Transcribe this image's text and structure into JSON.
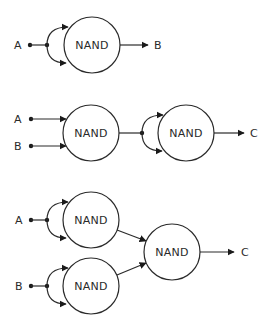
{
  "diagrams": [
    {
      "name": "not-gate-from-nand",
      "inputs": [
        "A"
      ],
      "gates": [
        "NAND"
      ],
      "output": "B"
    },
    {
      "name": "and-gate-from-nand",
      "inputs": [
        "A",
        "B"
      ],
      "gates": [
        "NAND",
        "NAND"
      ],
      "output": "C"
    },
    {
      "name": "or-gate-from-nand",
      "inputs": [
        "A",
        "B"
      ],
      "gates": [
        "NAND",
        "NAND",
        "NAND"
      ],
      "output": "C"
    }
  ],
  "colors": {
    "stroke": "#2a2a2a",
    "background": "#ffffff"
  }
}
